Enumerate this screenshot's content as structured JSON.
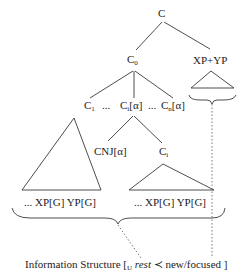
{
  "tree": {
    "root": {
      "label": "C"
    },
    "c0": {
      "label": "C",
      "sub": "0"
    },
    "xp_yp": {
      "label": "XP+YP"
    },
    "c1": {
      "label": "C",
      "sub": "1"
    },
    "dots1": {
      "label": "..."
    },
    "ci_alpha": {
      "label": "C",
      "sub": "i",
      "suffix": "[α]"
    },
    "dots2": {
      "label": "..."
    },
    "cn_alpha": {
      "label": "C",
      "sub": "n",
      "suffix": "[α]"
    },
    "cnj_alpha": {
      "label": "CNJ[α]"
    },
    "ci": {
      "label": "C",
      "sub": "i"
    },
    "left_leaves": {
      "label": "... XP[G] YP[G]"
    },
    "right_leaves": {
      "label": "... XP[G] YP[G]"
    }
  },
  "info_structure": {
    "prefix": "Information Structure [",
    "sub": "U",
    "rest": "rest",
    "prec": "≺",
    "new": "new/focused ]"
  },
  "colors": {
    "line": "#333333",
    "text": "#222222",
    "dotted": "#555555"
  }
}
